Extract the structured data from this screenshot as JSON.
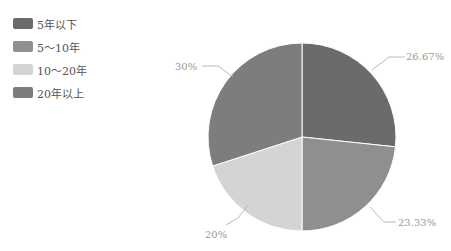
{
  "chart_data": {
    "type": "pie",
    "title": "",
    "categories": [
      "5年以下",
      "5～10年",
      "10～20年",
      "20年以上"
    ],
    "values": [
      26.67,
      23.33,
      20,
      30
    ],
    "labels": [
      "26.67%",
      "23.33%",
      "20%",
      "30%"
    ],
    "colors": [
      "#6b6b6b",
      "#8f8f8f",
      "#d4d4d4",
      "#7d7d7d"
    ],
    "legend_position": "top-left",
    "start_angle": "top, clockwise"
  },
  "legend": {
    "items": [
      {
        "label": "5年以下",
        "color": "#6b6b6b"
      },
      {
        "label": "5～10年",
        "color": "#8f8f8f"
      },
      {
        "label": "10～20年",
        "color": "#d4d4d4"
      },
      {
        "label": "20年以上",
        "color": "#7d7d7d"
      }
    ]
  },
  "slice_labels": {
    "s0": "26.67%",
    "s1": "23.33%",
    "s2": "20%",
    "s3": "30%"
  }
}
